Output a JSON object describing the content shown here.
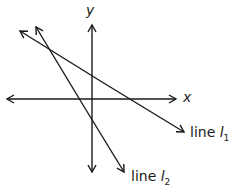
{
  "axes": {
    "x_label": "x",
    "y_label": "y"
  },
  "lines": [
    {
      "name": "line",
      "symbol": "l",
      "subscript": "1"
    },
    {
      "name": "line",
      "symbol": "l",
      "subscript": "2"
    }
  ],
  "colors": {
    "stroke": "#1a1a1a",
    "background": "#ffffff"
  }
}
